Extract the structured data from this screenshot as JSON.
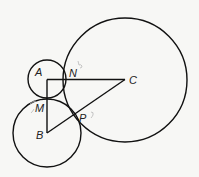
{
  "diagram": {
    "type": "geometry-figure",
    "points": {
      "A": {
        "label": "A"
      },
      "B": {
        "label": "B"
      },
      "C": {
        "label": "C"
      },
      "M": {
        "label": "M"
      },
      "N": {
        "label": "N"
      },
      "P": {
        "label": "P"
      }
    },
    "circles": [
      {
        "center": "A",
        "name": "circle-a"
      },
      {
        "center": "B",
        "name": "circle-b"
      },
      {
        "center": "C",
        "name": "circle-c"
      }
    ],
    "segments": [
      {
        "from": "A",
        "to": "C"
      },
      {
        "from": "A",
        "to": "B"
      },
      {
        "from": "B",
        "to": "C"
      }
    ],
    "colors": {
      "stroke": "#111111",
      "label": "#222222",
      "pencil_mark": "#b8b8b8",
      "background": "#f7f7f5"
    }
  }
}
